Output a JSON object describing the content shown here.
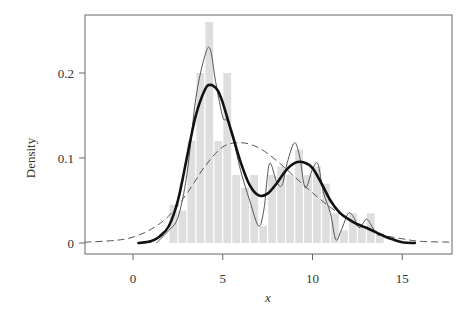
{
  "chart_data": {
    "type": "histogram",
    "title": "",
    "xlabel": "x",
    "ylabel": "Density",
    "xlim": [
      -2.7,
      17.8
    ],
    "ylim": [
      -0.013,
      0.27
    ],
    "x_ticks": [
      0,
      5,
      10,
      15
    ],
    "x_tick_labels": [
      "0",
      "5",
      "10",
      "15"
    ],
    "y_ticks": [
      0,
      0.1,
      0.2
    ],
    "y_tick_labels": [
      "0",
      "0.1",
      "0.2"
    ],
    "grid": false,
    "legend": null,
    "histogram": {
      "bin_width": 0.5,
      "bins_start": [
        2.0,
        2.5,
        3.0,
        3.5,
        4.0,
        4.5,
        5.0,
        5.5,
        6.0,
        6.5,
        7.0,
        7.5,
        8.0,
        8.5,
        9.0,
        9.5,
        10.0,
        10.5,
        11.0,
        11.5,
        12.0,
        12.5,
        13.0,
        13.5
      ],
      "density": [
        0.045,
        0.038,
        0.12,
        0.2,
        0.26,
        0.12,
        0.2,
        0.08,
        0.065,
        0.08,
        0.02,
        0.08,
        0.09,
        0.08,
        0.11,
        0.08,
        0.09,
        0.07,
        0.035,
        0.015,
        0.035,
        0.02,
        0.035,
        0.01
      ],
      "color": "#dedede"
    },
    "series": [
      {
        "name": "thick-kde",
        "style": "solid-thick",
        "color": "#111111",
        "x": [
          0.3,
          1.0,
          1.5,
          2.0,
          2.5,
          3.0,
          3.5,
          4.0,
          4.3,
          4.7,
          5.0,
          5.5,
          6.0,
          6.5,
          7.0,
          7.5,
          8.0,
          8.5,
          9.0,
          9.5,
          10.0,
          10.5,
          11.0,
          11.5,
          12.0,
          12.5,
          13.0,
          13.5,
          14.0,
          14.5,
          15.0,
          15.7
        ],
        "y": [
          0.0,
          0.002,
          0.008,
          0.02,
          0.05,
          0.1,
          0.15,
          0.18,
          0.186,
          0.18,
          0.165,
          0.13,
          0.095,
          0.068,
          0.056,
          0.058,
          0.07,
          0.085,
          0.094,
          0.095,
          0.088,
          0.07,
          0.05,
          0.036,
          0.028,
          0.022,
          0.018,
          0.013,
          0.008,
          0.004,
          0.001,
          0.0
        ]
      },
      {
        "name": "thin-kde",
        "style": "solid-thin",
        "color": "#555555",
        "x": [
          1.3,
          2.0,
          2.5,
          3.0,
          3.5,
          4.0,
          4.3,
          4.6,
          5.0,
          5.2,
          5.5,
          6.0,
          6.5,
          7.0,
          7.3,
          7.6,
          8.0,
          8.3,
          8.6,
          9.0,
          9.3,
          9.6,
          10.0,
          10.3,
          10.6,
          11.0,
          11.3,
          11.6,
          12.0,
          12.3,
          12.6,
          13.0,
          13.3,
          13.6,
          14.0,
          14.5,
          15.0,
          15.5
        ],
        "y": [
          0.0,
          0.015,
          0.03,
          0.08,
          0.17,
          0.22,
          0.228,
          0.19,
          0.148,
          0.145,
          0.13,
          0.085,
          0.05,
          0.02,
          0.04,
          0.093,
          0.072,
          0.068,
          0.095,
          0.118,
          0.1,
          0.065,
          0.087,
          0.093,
          0.06,
          0.035,
          0.004,
          0.015,
          0.035,
          0.03,
          0.018,
          0.028,
          0.02,
          0.01,
          0.008,
          0.004,
          0.001,
          0.0
        ]
      },
      {
        "name": "normal-fit",
        "style": "dashed",
        "color": "#555555",
        "x": [
          -2.7,
          -1,
          0,
          1,
          2,
          3,
          4,
          5,
          6,
          7,
          8,
          9,
          10,
          11,
          12,
          13,
          14,
          15,
          16,
          17.8
        ],
        "y": [
          0.001,
          0.003,
          0.007,
          0.016,
          0.032,
          0.058,
          0.09,
          0.113,
          0.118,
          0.112,
          0.097,
          0.078,
          0.059,
          0.042,
          0.028,
          0.017,
          0.009,
          0.005,
          0.002,
          0.001
        ]
      }
    ]
  }
}
